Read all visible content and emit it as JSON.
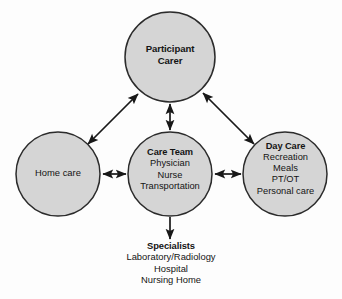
{
  "diagram": {
    "style": {
      "node_fill": "#d5d5d5",
      "node_stroke": "#2b2b2b",
      "arrow_color": "#181818",
      "background": "#fdfdfd",
      "text_color": "#141414"
    },
    "nodes": [
      {
        "id": "participant-carer",
        "shape": "circle",
        "title": "Participant",
        "lines": [
          "Carer"
        ],
        "bold_lines": [
          "Participant",
          "Carer"
        ],
        "cx": 170,
        "cy": 57,
        "r": 45
      },
      {
        "id": "home-care",
        "shape": "circle",
        "title": "Home care",
        "lines": [],
        "bold_lines": [],
        "cx": 58,
        "cy": 174,
        "r": 42
      },
      {
        "id": "care-team",
        "shape": "circle",
        "title": "Care Team",
        "lines": [
          "Physician",
          "Nurse",
          "Transportation"
        ],
        "bold_lines": [
          "Care Team"
        ],
        "cx": 170,
        "cy": 174,
        "r": 42
      },
      {
        "id": "day-care",
        "shape": "circle",
        "title": "Day Care",
        "lines": [
          "Recreation",
          "Meals",
          "PT/OT",
          "Personal care"
        ],
        "bold_lines": [
          "Day Care"
        ],
        "cx": 285,
        "cy": 174,
        "r": 42
      },
      {
        "id": "specialists",
        "shape": "text",
        "title": "Specialists",
        "lines": [
          "Laboratory/Radiology",
          "Hospital",
          "Nursing Home"
        ],
        "bold_lines": [
          "Specialists"
        ],
        "cx": 170,
        "cy": 262
      }
    ],
    "edges": [
      {
        "id": "edge-home-participant",
        "from": "home-care",
        "to": "participant-carer",
        "arrow": "double",
        "x1": 88,
        "y1": 144,
        "x2": 138,
        "y2": 94
      },
      {
        "id": "edge-participant-careteam",
        "from": "participant-carer",
        "to": "care-team",
        "arrow": "double",
        "x1": 170,
        "y1": 104,
        "x2": 170,
        "y2": 130
      },
      {
        "id": "edge-participant-daycare",
        "from": "participant-carer",
        "to": "day-care",
        "arrow": "double",
        "x1": 203,
        "y1": 93,
        "x2": 254,
        "y2": 144
      },
      {
        "id": "edge-home-careteam",
        "from": "home-care",
        "to": "care-team",
        "arrow": "double",
        "x1": 102,
        "y1": 174,
        "x2": 126,
        "y2": 174
      },
      {
        "id": "edge-careteam-daycare",
        "from": "care-team",
        "to": "day-care",
        "arrow": "double",
        "x1": 214,
        "y1": 174,
        "x2": 241,
        "y2": 174
      },
      {
        "id": "edge-careteam-specialists",
        "from": "care-team",
        "to": "specialists",
        "arrow": "single",
        "x1": 170,
        "y1": 217,
        "x2": 170,
        "y2": 240
      }
    ]
  },
  "labels": {
    "participant": {
      "title": "Participant",
      "line1": "Carer"
    },
    "home": {
      "title": "Home care"
    },
    "careteam": {
      "title": "Care Team",
      "line1": "Physician",
      "line2": "Nurse",
      "line3": "Transportation"
    },
    "daycare": {
      "title": "Day Care",
      "line1": "Recreation",
      "line2": "Meals",
      "line3": "PT/OT",
      "line4": "Personal care"
    },
    "specialists": {
      "title": "Specialists",
      "line1": "Laboratory/Radiology",
      "line2": "Hospital",
      "line3": "Nursing Home"
    }
  }
}
